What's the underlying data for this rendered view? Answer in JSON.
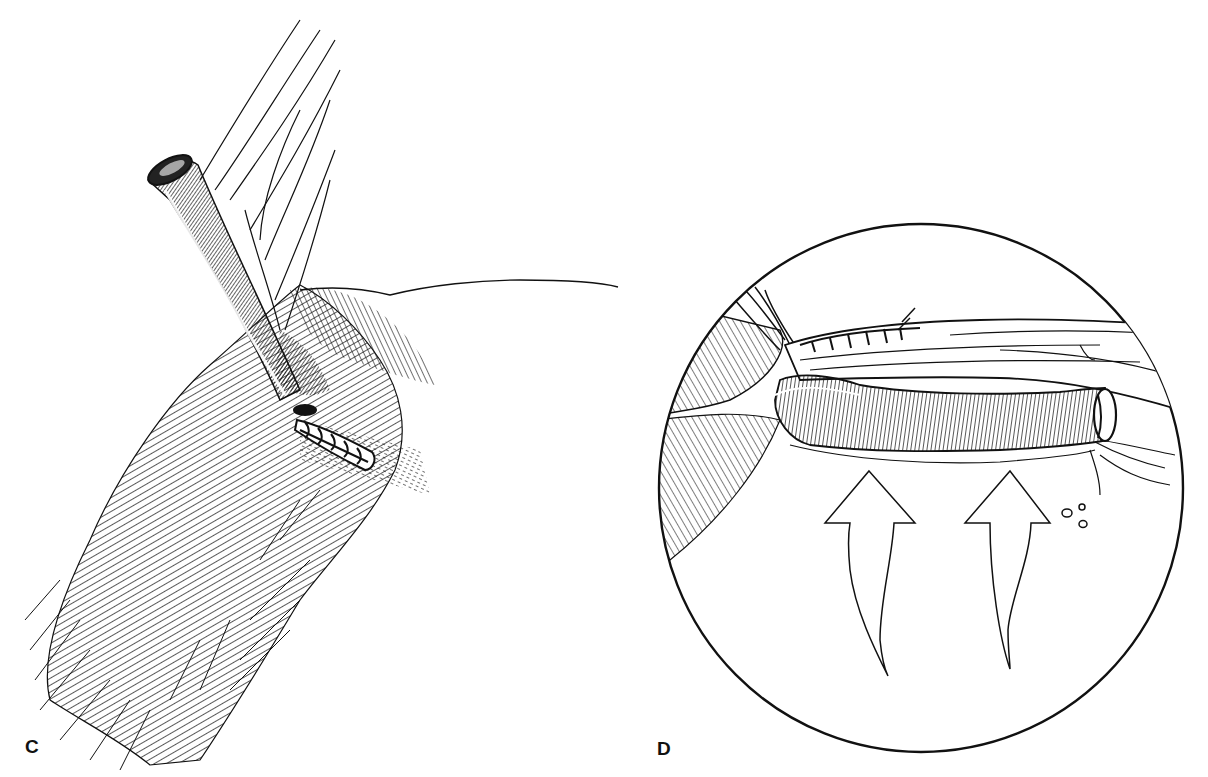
{
  "figure": {
    "panels": [
      {
        "id": "C",
        "label": "C",
        "description": "Vessel emerging through muscle with sutured end"
      },
      {
        "id": "D",
        "label": "D",
        "description": "Circular magnified view of vessel with suture line and upward arrows"
      }
    ],
    "colors": {
      "background": "#ffffff",
      "ink": "#111111"
    }
  }
}
